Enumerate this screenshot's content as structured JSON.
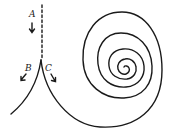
{
  "diagram": {
    "type": "trajectory-spiral",
    "labels": {
      "a": "A",
      "b": "B",
      "c": "C"
    },
    "colors": {
      "stroke": "#1a1a1a",
      "background": "#ffffff"
    }
  }
}
